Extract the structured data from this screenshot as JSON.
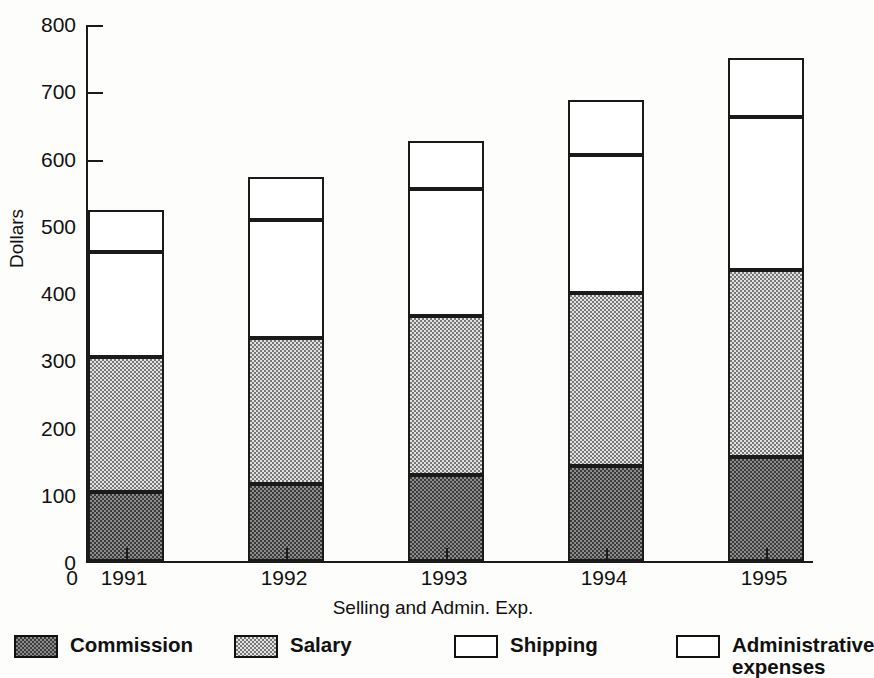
{
  "chart_data": {
    "type": "bar",
    "subtype": "stacked-bar",
    "title": "",
    "xlabel": "Selling and Admin. Exp.",
    "ylabel": "Dollars",
    "categories": [
      "1991",
      "1992",
      "1993",
      "1994",
      "1995"
    ],
    "ylim": [
      0,
      800
    ],
    "yticks": [
      0,
      100,
      200,
      300,
      400,
      500,
      600,
      700,
      800
    ],
    "ytick_labels": [
      "0",
      "100",
      "200",
      "300",
      "400",
      "500",
      "600",
      "700",
      "800"
    ],
    "xtick_labels": [
      "0",
      "1991",
      "1992",
      "1993",
      "1994",
      "1995"
    ],
    "grid": false,
    "legend_position": "bottom",
    "stacked_totals": [
      522,
      571,
      624,
      686,
      748
    ],
    "series": [
      {
        "name": "Commission",
        "fill": "dark-dotted",
        "color": "#8c8c8c",
        "values": [
          102,
          115,
          128,
          142,
          155
        ]
      },
      {
        "name": "Salary",
        "fill": "light-dotted",
        "color": "#e2e2e2",
        "values": [
          201,
          216,
          236,
          256,
          277
        ],
        "cumulative_tops": [
          303,
          331,
          364,
          398,
          432
        ]
      },
      {
        "name": "Shipping",
        "fill": "white",
        "color": "#ffffff",
        "values": [
          157,
          176,
          189,
          206,
          228
        ],
        "cumulative_tops": [
          460,
          507,
          553,
          604,
          660
        ]
      },
      {
        "name": "Administrative\nexpenses",
        "fill": "white",
        "color": "#ffffff",
        "values": [
          62,
          64,
          71,
          82,
          88
        ],
        "cumulative_tops": [
          522,
          571,
          624,
          686,
          748
        ]
      }
    ]
  },
  "axes": {
    "y_title": "Dollars",
    "x_title": "Selling and Admin. Exp.",
    "y_labels": [
      "800",
      "700",
      "600",
      "500",
      "400",
      "300",
      "200",
      "100",
      "0"
    ],
    "x_labels": [
      "0",
      "1991",
      "1992",
      "1993",
      "1994",
      "1995"
    ]
  },
  "legend": {
    "items": [
      {
        "label": "Commission",
        "swatch": "commission-swatch"
      },
      {
        "label": "Salary",
        "swatch": "salary-swatch"
      },
      {
        "label": "Shipping",
        "swatch": "shipping-swatch"
      },
      {
        "label": "Administrative\nexpenses",
        "swatch": "administrative-expenses-swatch"
      }
    ]
  }
}
